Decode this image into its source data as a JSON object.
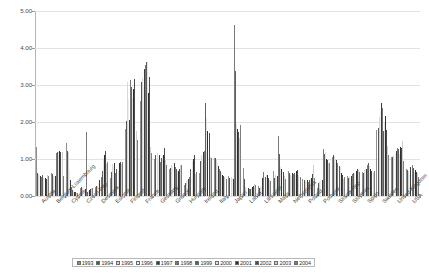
{
  "chart_data": {
    "type": "bar",
    "title": "",
    "xlabel": "",
    "ylabel": "",
    "ylim": [
      0,
      5
    ],
    "yticks": [
      "0.00",
      "1.00",
      "2.00",
      "3.00",
      "4.00",
      "5.00"
    ],
    "ytick_values": [
      0,
      1,
      2,
      3,
      4,
      5
    ],
    "grid": true,
    "legend_position": "bottom",
    "categories": [
      "Austria",
      "Belgium-Luxembourg",
      "Cyprus",
      "Czech Rep",
      "Denmark",
      "Estonia",
      "Finland",
      "France",
      "Germany",
      "Greece",
      "Hungary",
      "Ireland",
      "Italy",
      "Japan",
      "Latvia",
      "Lithuania",
      "Malta",
      "Netherlands",
      "Poland",
      "Portugal",
      "Slovak Rep",
      "Slovenia",
      "Spain",
      "Sweden",
      "United Kingdom",
      "USA"
    ],
    "series": [
      {
        "name": "1993",
        "values": [
          1.32,
          0.63,
          1.42,
          0.22,
          0.24,
          0.5,
          1.81,
          2.58,
          1.01,
          0.73,
          0.3,
          0.63,
          1.02,
          0.55,
          0.75,
          0.26,
          0.68,
          0.68,
          0.47,
          0.22,
          1.05,
          0.55,
          0.65,
          1.79,
          1.05,
          0.74
        ]
      },
      {
        "name": "1994",
        "values": [
          0.61,
          0.6,
          1.22,
          0.25,
          0.26,
          0.66,
          2.04,
          3.09,
          1.12,
          0.76,
          0.36,
          0.95,
          1.04,
          0.49,
          0.46,
          0.22,
          0.5,
          0.62,
          0.43,
          0.35,
          1.11,
          0.5,
          0.63,
          1.85,
          1.06,
          0.71
        ]
      },
      {
        "name": "1995",
        "values": [
          0.6,
          0.53,
          1.19,
          0.21,
          0.27,
          0.87,
          3.08,
          3.18,
          1.15,
          0.85,
          0.4,
          1.12,
          0.99,
          0.52,
          0.24,
          0.25,
          0.56,
          0.58,
          0.41,
          0.4,
          1.08,
          0.52,
          0.7,
          2.13,
          1.07,
          0.68
        ]
      },
      {
        "name": "1996",
        "values": [
          0.56,
          0.52,
          0.7,
          0.2,
          0.36,
          0.82,
          2.62,
          2.94,
          1.05,
          0.8,
          0.43,
          1.06,
          0.92,
          0.48,
          0.22,
          0.31,
          0.51,
          0.54,
          0.4,
          0.41,
          0.98,
          0.48,
          0.78,
          2.31,
          1.17,
          0.6
        ]
      },
      {
        "name": "1997",
        "values": [
          0.55,
          0.55,
          0.44,
          0.19,
          0.43,
          0.89,
          2.05,
          3.42,
          1.12,
          0.88,
          0.47,
          1.19,
          0.82,
          0.45,
          0.21,
          0.49,
          0.55,
          0.62,
          0.42,
          0.42,
          0.96,
          0.55,
          0.73,
          2.52,
          1.22,
          0.78
        ]
      },
      {
        "name": "1998",
        "values": [
          0.52,
          1.17,
          0.24,
          1.72,
          0.51,
          0.62,
          3.13,
          3.55,
          0.93,
          0.78,
          0.52,
          1.21,
          0.73,
          4.63,
          0.18,
          0.65,
          1.63,
          0.59,
          0.38,
          1.28,
          0.88,
          0.6,
          0.84,
          2.38,
          1.29,
          0.85
        ]
      },
      {
        "name": "1999",
        "values": [
          0.56,
          1.19,
          0.17,
          0.12,
          0.67,
          0.73,
          2.94,
          3.63,
          1.02,
          0.72,
          0.74,
          2.51,
          0.68,
          3.37,
          0.19,
          0.52,
          1.13,
          0.63,
          0.42,
          1.14,
          0.82,
          0.63,
          0.88,
          1.75,
          1.27,
          0.75
        ]
      },
      {
        "name": "2000",
        "values": [
          0.5,
          1.2,
          0.13,
          0.14,
          1.04,
          0.67,
          2.66,
          3.61,
          1.08,
          0.66,
          0.94,
          2.1,
          0.63,
          1.94,
          0.21,
          0.58,
          0.78,
          0.56,
          0.45,
          1.19,
          0.79,
          0.63,
          0.8,
          1.97,
          1.14,
          0.66
        ]
      },
      {
        "name": "2001",
        "values": [
          0.49,
          1.21,
          0.12,
          0.16,
          1.12,
          0.88,
          2.9,
          2.79,
          1.11,
          0.67,
          1.0,
          1.77,
          0.58,
          1.8,
          0.24,
          0.56,
          0.72,
          0.67,
          0.49,
          0.99,
          0.62,
          0.68,
          0.74,
          2.15,
          1.32,
          0.7
        ]
      },
      {
        "name": "2002",
        "values": [
          0.47,
          1.2,
          0.1,
          0.18,
          1.23,
          0.92,
          3.15,
          3.23,
          1.29,
          0.72,
          1.12,
          1.69,
          0.53,
          1.74,
          0.26,
          0.48,
          0.66,
          0.69,
          0.6,
          0.98,
          0.58,
          0.72,
          0.68,
          1.78,
          1.3,
          0.65
        ]
      },
      {
        "name": "2003",
        "values": [
          0.56,
          1.18,
          0.09,
          0.21,
          0.86,
          0.86,
          1.76,
          1.32,
          0.98,
          0.83,
          0.6,
          1.06,
          0.51,
          1.58,
          0.32,
          0.43,
          0.54,
          0.57,
          0.85,
          0.9,
          0.46,
          0.7,
          0.63,
          1.36,
          1.48,
          0.61
        ]
      },
      {
        "name": "2004",
        "values": [
          0.54,
          0.55,
          0.07,
          0.23,
          0.91,
          0.92,
          1.52,
          1.15,
          0.84,
          0.85,
          0.64,
          1.04,
          0.46,
          1.93,
          0.3,
          0.41,
          0.46,
          0.52,
          0.48,
          0.88,
          0.52,
          0.66,
          0.67,
          1.1,
          0.94,
          0.52
        ]
      }
    ]
  },
  "legend": {
    "items": [
      {
        "label": "1993",
        "swatch": "swatch-1993"
      },
      {
        "label": "1994",
        "swatch": "swatch-1994"
      },
      {
        "label": "1995",
        "swatch": "swatch-1995"
      },
      {
        "label": "1996",
        "swatch": "swatch-1996"
      },
      {
        "label": "1997",
        "swatch": "swatch-1997"
      },
      {
        "label": "1998",
        "swatch": "swatch-1998"
      },
      {
        "label": "1999",
        "swatch": "swatch-1999"
      },
      {
        "label": "2000",
        "swatch": "swatch-2000"
      },
      {
        "label": "2001",
        "swatch": "swatch-2001"
      },
      {
        "label": "2002",
        "swatch": "swatch-2002"
      },
      {
        "label": "2003",
        "swatch": "swatch-2003"
      },
      {
        "label": "2004",
        "swatch": "swatch-2004"
      }
    ]
  },
  "colors": {
    "gridline": "#e2e2e2",
    "axis": "#a8a8a8",
    "text": "#3f3f3f",
    "plot_background": "#ffffff"
  }
}
